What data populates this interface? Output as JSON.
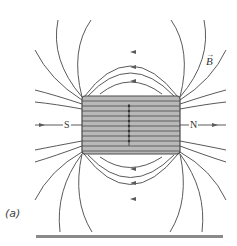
{
  "figure": {
    "caption": "(a)",
    "field_label": "B",
    "south_label": "S",
    "north_label": "N"
  },
  "colors": {
    "field_line": "#5a5a5a",
    "solenoid_fill": "#b8b8b8",
    "solenoid_stroke": "#4a4a4a"
  }
}
